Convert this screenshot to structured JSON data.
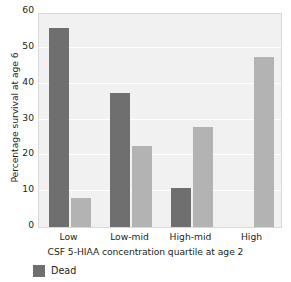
{
  "chart_data": {
    "type": "bar",
    "title": "",
    "subtitle": "",
    "xlabel": "CSF 5-HIAA concentration quartile at age 2",
    "ylabel": "Percentage survival at age 6",
    "categories": [
      "Low",
      "Low-mid",
      "High-mid",
      "High"
    ],
    "series": [
      {
        "name": "Dead",
        "color": "#6f6f6f",
        "values": [
          55.5,
          37.5,
          11.0,
          0
        ]
      },
      {
        "name": "Alive",
        "color": "#b3b3b3",
        "values": [
          8.0,
          22.5,
          28.0,
          47.5
        ]
      }
    ],
    "ylim": [
      0,
      60
    ],
    "yticks": [
      0,
      10,
      20,
      30,
      40,
      50,
      60
    ],
    "ytick_labels": [
      "0",
      "10",
      "20",
      "30",
      "40",
      "50",
      "60"
    ],
    "grid": true,
    "grid_axis": "y",
    "legend_position": "bottom-left",
    "legend_entries": [
      {
        "label": "Dead",
        "color": "#6f6f6f"
      }
    ],
    "plot_background": "#f1f1f1",
    "gridline_color": "#ffffff"
  }
}
